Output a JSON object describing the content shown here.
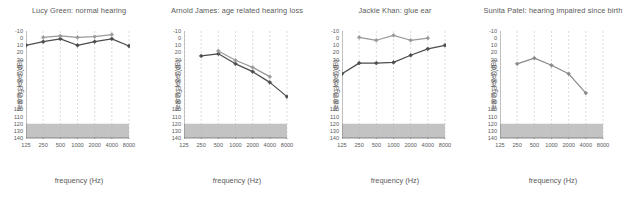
{
  "figure": {
    "panel_count": 4,
    "background": "#ffffff",
    "axis_color": "#6e6e6e",
    "gridline_color": "#b9b9b9",
    "shade_color": "#9e9e9e",
    "shade_range_db": [
      120,
      140
    ]
  },
  "axes": {
    "xlabel": "frequency (Hz)",
    "ylabel": "hearing level (dB)",
    "x_ticks": [
      "125",
      "250",
      "500",
      "1000",
      "2000",
      "4000",
      "8000"
    ],
    "x_values": [
      125,
      250,
      500,
      1000,
      2000,
      4000,
      8000
    ],
    "x_scale": "log",
    "y_ticks": [
      "-10",
      "0",
      "10",
      "20",
      "30",
      "40",
      "50",
      "60",
      "70",
      "80",
      "90",
      "100",
      "110",
      "120",
      "130",
      "140"
    ],
    "y_values": [
      -10,
      0,
      10,
      20,
      30,
      40,
      50,
      60,
      70,
      80,
      90,
      100,
      110,
      120,
      130,
      140
    ],
    "ylim": [
      -10,
      140
    ],
    "y_inverted": true,
    "grid": "vertical-dashed"
  },
  "chart_data": [
    {
      "type": "line",
      "title": "Lucy Green: normal hearing",
      "xlabel": "frequency (Hz)",
      "ylabel": "hearing level (dB)",
      "x": [
        125,
        250,
        500,
        1000,
        2000,
        4000,
        8000
      ],
      "ylim": [
        -10,
        140
      ],
      "series": [
        {
          "name": "air-conduction",
          "color": "#4d4d4d",
          "x": [
            125,
            250,
            500,
            1000,
            2000,
            4000,
            8000
          ],
          "values": [
            10,
            5,
            1,
            10,
            5,
            1,
            11
          ]
        },
        {
          "name": "bone-conduction",
          "color": "#9a9a9a",
          "x": [
            250,
            500,
            1000,
            2000,
            4000
          ],
          "values": [
            -1,
            -3,
            -1,
            -2,
            -5
          ]
        }
      ]
    },
    {
      "type": "line",
      "title": "Arnold James: age related hearing loss",
      "xlabel": "frequency (Hz)",
      "ylabel": "hearing level (dB)",
      "x": [
        125,
        250,
        500,
        1000,
        2000,
        4000,
        8000
      ],
      "ylim": [
        -10,
        140
      ],
      "series": [
        {
          "name": "air-conduction",
          "color": "#4d4d4d",
          "x": [
            250,
            500,
            1000,
            2000,
            4000,
            8000
          ],
          "values": [
            25,
            22,
            36,
            47,
            62,
            82
          ]
        },
        {
          "name": "bone-conduction",
          "color": "#9a9a9a",
          "x": [
            500,
            1000,
            2000,
            4000
          ],
          "values": [
            18,
            31,
            41,
            54
          ]
        }
      ]
    },
    {
      "type": "line",
      "title": "Jackie Khan: glue ear",
      "xlabel": "frequency (Hz)",
      "ylabel": "hearing level (dB)",
      "x": [
        125,
        250,
        500,
        1000,
        2000,
        4000,
        8000
      ],
      "ylim": [
        -10,
        140
      ],
      "series": [
        {
          "name": "air-conduction",
          "color": "#4d4d4d",
          "x": [
            125,
            250,
            500,
            1000,
            2000,
            4000,
            8000
          ],
          "values": [
            50,
            35,
            35,
            34,
            24,
            15,
            10
          ]
        },
        {
          "name": "bone-conduction",
          "color": "#9a9a9a",
          "x": [
            250,
            500,
            1000,
            2000,
            4000
          ],
          "values": [
            -1,
            3,
            -4,
            3,
            0
          ]
        }
      ]
    },
    {
      "type": "line",
      "title": "Sunita Patel: hearing impaired since birth",
      "xlabel": "frequency (Hz)",
      "ylabel": "hearing level (dB)",
      "x": [
        125,
        250,
        500,
        1000,
        2000,
        4000,
        8000
      ],
      "ylim": [
        -10,
        140
      ],
      "series": [
        {
          "name": "air-conduction",
          "color": "#8a8a8a",
          "x": [
            250,
            500,
            1000,
            2000,
            4000
          ],
          "values": [
            36,
            28,
            38,
            50,
            77
          ]
        }
      ]
    }
  ]
}
